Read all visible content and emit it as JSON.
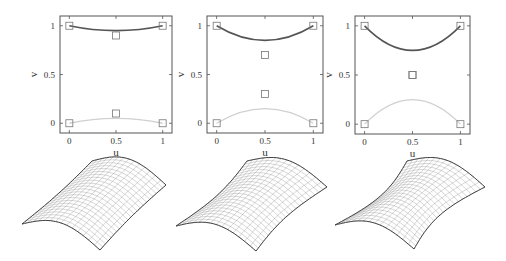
{
  "chart_data": [
    {
      "type": "line",
      "title": "",
      "xlabel": "u",
      "ylabel": "v",
      "xlim": [
        -0.1,
        1.1
      ],
      "ylim": [
        -0.1,
        1.1
      ],
      "xticks": [
        "0",
        "0.5",
        "1"
      ],
      "yticks": [
        "0",
        "0.5",
        "1"
      ],
      "control_points": [
        [
          0,
          1
        ],
        [
          0.5,
          0.9
        ],
        [
          1,
          1
        ],
        [
          0,
          0
        ],
        [
          0.5,
          0.1
        ],
        [
          1,
          0
        ]
      ],
      "series": [
        {
          "name": "top boundary curve",
          "color": "#555555",
          "x": [
            0,
            0.25,
            0.5,
            0.75,
            1
          ],
          "y": [
            1,
            0.963,
            0.95,
            0.963,
            1
          ]
        },
        {
          "name": "bottom boundary curve",
          "color": "#cccccc",
          "x": [
            0,
            0.25,
            0.5,
            0.75,
            1
          ],
          "y": [
            0,
            0.038,
            0.05,
            0.038,
            0
          ]
        }
      ]
    },
    {
      "type": "line",
      "title": "",
      "xlabel": "u",
      "ylabel": "v",
      "xlim": [
        -0.1,
        1.1
      ],
      "ylim": [
        -0.1,
        1.1
      ],
      "xticks": [
        "0",
        "0.5",
        "1"
      ],
      "yticks": [
        "0",
        "0.5",
        "1"
      ],
      "control_points": [
        [
          0,
          1
        ],
        [
          0.5,
          0.7
        ],
        [
          1,
          1
        ],
        [
          0,
          0
        ],
        [
          0.5,
          0.3
        ],
        [
          1,
          0
        ]
      ],
      "series": [
        {
          "name": "top boundary curve",
          "color": "#555555",
          "x": [
            0,
            0.25,
            0.5,
            0.75,
            1
          ],
          "y": [
            1,
            0.888,
            0.85,
            0.888,
            1
          ]
        },
        {
          "name": "bottom boundary curve",
          "color": "#cccccc",
          "x": [
            0,
            0.25,
            0.5,
            0.75,
            1
          ],
          "y": [
            0,
            0.113,
            0.15,
            0.113,
            0
          ]
        }
      ]
    },
    {
      "type": "line",
      "title": "",
      "xlabel": "u",
      "ylabel": "v",
      "xlim": [
        -0.1,
        1.1
      ],
      "ylim": [
        -0.1,
        1.1
      ],
      "xticks": [
        "0",
        "0.5",
        "1"
      ],
      "yticks": [
        "0",
        "0.5",
        "1"
      ],
      "control_points": [
        [
          0,
          1
        ],
        [
          0.5,
          0.5
        ],
        [
          1,
          1
        ],
        [
          0,
          0
        ],
        [
          0.5,
          0.5
        ],
        [
          1,
          0
        ]
      ],
      "series": [
        {
          "name": "top boundary curve",
          "color": "#555555",
          "x": [
            0,
            0.25,
            0.5,
            0.75,
            1
          ],
          "y": [
            1,
            0.8125,
            0.75,
            0.8125,
            1
          ]
        },
        {
          "name": "bottom boundary curve",
          "color": "#cccccc",
          "x": [
            0,
            0.25,
            0.5,
            0.75,
            1
          ],
          "y": [
            0,
            0.1875,
            0.25,
            0.1875,
            0
          ]
        }
      ]
    }
  ],
  "labels": {
    "u": "u",
    "v": "v",
    "t0": "0",
    "t05": "0.5",
    "t1": "1"
  },
  "surfaces": [
    {
      "name": "surface-1",
      "mid_sag": 0.1
    },
    {
      "name": "surface-2",
      "mid_sag": 0.3
    },
    {
      "name": "surface-3",
      "mid_sag": 0.5
    }
  ]
}
